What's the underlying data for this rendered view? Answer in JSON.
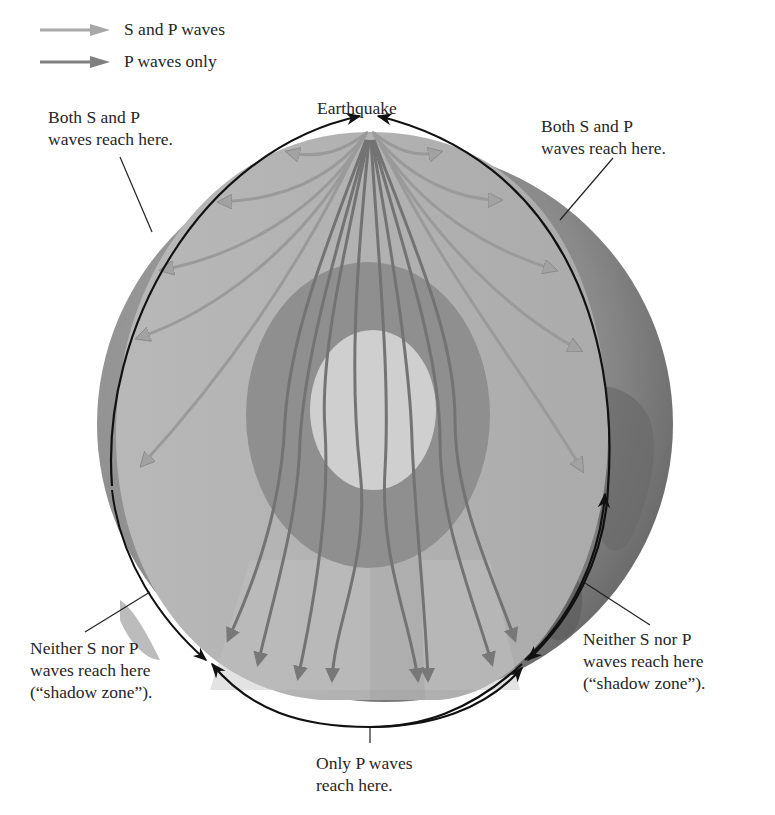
{
  "legend": {
    "items": [
      {
        "label": "S and P waves",
        "color": "#a8a8a8"
      },
      {
        "label": "P waves only",
        "color": "#808080"
      }
    ]
  },
  "labels": {
    "earthquake": "Earthquake",
    "top_left": {
      "line1": "Both S and P",
      "line2": "waves reach here."
    },
    "top_right": {
      "line1": "Both S and P",
      "line2": "waves reach here."
    },
    "bottom_left": {
      "line1": "Neither S nor P",
      "line2": "waves reach here",
      "line3": "(“shadow zone”)."
    },
    "bottom_right": {
      "line1": "Neither S nor P",
      "line2": "waves reach here",
      "line3": "(“shadow zone”)."
    },
    "bottom_center": {
      "line1": "Only P waves",
      "line2": "reach here."
    }
  },
  "colors": {
    "background": "#ffffff",
    "crust_globe": "#8e8e8e",
    "mantle_face": "#b4b4b4",
    "outer_core": "#8f8f8f",
    "inner_core": "#cfcfcf",
    "s_and_p_wave": "#a8a8a8",
    "p_wave": "#7a7a7a",
    "annotation_arc": "#111111"
  },
  "layers": [
    {
      "name": "crust-and-mantle"
    },
    {
      "name": "outer-core"
    },
    {
      "name": "inner-core"
    }
  ]
}
